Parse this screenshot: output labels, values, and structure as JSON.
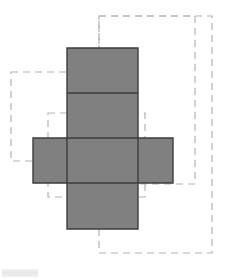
{
  "canvas": {
    "width": 225,
    "height": 279,
    "background_color": "#ffffff"
  },
  "figure": {
    "solid_fill_color": "#808080",
    "solid_stroke_color": "#3d3d3d",
    "solid_stroke_width": 1.4,
    "dashed_stroke_color": "#b3b3b3",
    "dashed_stroke_width": 1.2,
    "dash_pattern": "7 5"
  },
  "net": {
    "shape": "cross",
    "square_size": 70,
    "faces": [
      {
        "name": "top-face",
        "x": 67,
        "y": 48,
        "width": 71,
        "height": 45
      },
      {
        "name": "upper-middle-face",
        "x": 67,
        "y": 93,
        "width": 71,
        "height": 45
      },
      {
        "name": "left-face",
        "x": 33,
        "y": 138,
        "width": 34,
        "height": 45
      },
      {
        "name": "center-face",
        "x": 67,
        "y": 138,
        "width": 71,
        "height": 45
      },
      {
        "name": "right-face",
        "x": 138,
        "y": 138,
        "width": 35,
        "height": 45
      },
      {
        "name": "bottom-face",
        "x": 67,
        "y": 183,
        "width": 71,
        "height": 46
      }
    ],
    "vertical_strip": {
      "x": 67,
      "y": 48,
      "width": 71,
      "height": 181
    },
    "horizontal_arm": {
      "x": 33,
      "y": 138,
      "width": 140,
      "height": 45
    }
  },
  "dashed_rectangles": [
    {
      "name": "outer-right-rectangle",
      "x": 99,
      "y": 16,
      "width": 113,
      "height": 237
    },
    {
      "name": "upper-right-rectangle",
      "x": 99,
      "y": 16,
      "width": 96,
      "height": 168
    },
    {
      "name": "left-rectangle",
      "x": 11,
      "y": 72,
      "width": 116,
      "height": 89
    },
    {
      "name": "inner-center-rectangle",
      "x": 48,
      "y": 113,
      "width": 97,
      "height": 84
    }
  ],
  "watermark": {
    "present": true,
    "label": ""
  }
}
